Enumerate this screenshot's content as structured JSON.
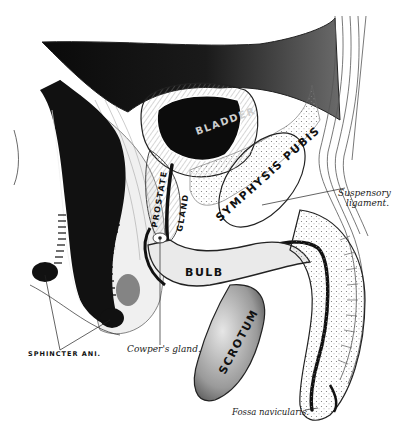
{
  "figure": {
    "colors": {
      "ink": "#111111",
      "shade": "#555555",
      "light": "#d9d9d9",
      "paper": "#ffffff"
    }
  },
  "organ_labels": {
    "bladder": "BLADDER",
    "prostate": "PROSTATE",
    "gland": "GLAND",
    "symphysis": "SYMPHYSIS PUBIS",
    "rectum": "RECTUM",
    "bulb": "BULB",
    "scrotum": "SCROTUM"
  },
  "callouts": {
    "suspensory_1": "Suspensory",
    "suspensory_2": "ligament.",
    "sphincter": "SPHINCTER ANI.",
    "cowper": "Cowper's gland.",
    "fossa": "Fossa navicularis."
  }
}
